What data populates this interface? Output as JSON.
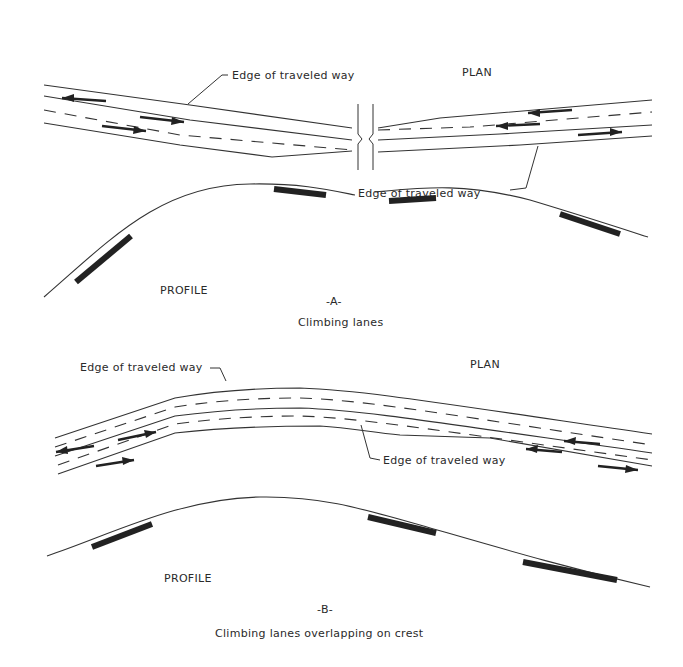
{
  "figure": {
    "panel_a": {
      "plan_label": "PLAN",
      "edge_label_top": "Edge of traveled way",
      "edge_label_bottom": "Edge of traveled way",
      "profile_label": "PROFILE",
      "panel_id": "-A-",
      "caption": "Climbing lanes"
    },
    "panel_b": {
      "plan_label": "PLAN",
      "edge_label_top": "Edge of traveled way",
      "edge_label_bottom": "Edge of traveled way",
      "profile_label": "PROFILE",
      "panel_id": "-B-",
      "caption": "Climbing lanes overlapping on crest"
    }
  },
  "colors": {
    "background": "#ffffff",
    "line": "#333333",
    "hatch": "#222222"
  }
}
